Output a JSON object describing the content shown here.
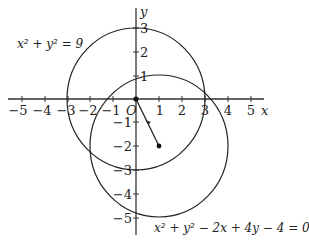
{
  "diagram": {
    "type": "coordinate-plane-circles",
    "axes": {
      "x_label": "x",
      "y_label": "y",
      "origin_label": "O",
      "x_ticks": [
        "−5",
        "−4",
        "−3",
        "−2",
        "−1",
        "1",
        "2",
        "3",
        "4",
        "5"
      ],
      "y_ticks": [
        "3",
        "2",
        "1",
        "−1",
        "−2",
        "−3",
        "−4",
        "−5"
      ],
      "x_range": [
        -5,
        5
      ],
      "y_range": [
        -5,
        3
      ]
    },
    "circles": [
      {
        "equation": "x² + y² = 9",
        "center": [
          0,
          0
        ],
        "radius": 3
      },
      {
        "equation": "x² + y² − 2x + 4y − 4 = 0",
        "center": [
          1,
          -2
        ],
        "radius": 3
      }
    ],
    "segment": {
      "from": [
        0,
        0
      ],
      "to": [
        1,
        -2
      ],
      "arrow": true
    },
    "labels": {
      "circle1": "x² + y² = 9",
      "circle2": "x² + y² − 2x + 4y − 4 = 0"
    },
    "colors": {
      "stroke": "#222222",
      "background": "#ffffff"
    }
  }
}
